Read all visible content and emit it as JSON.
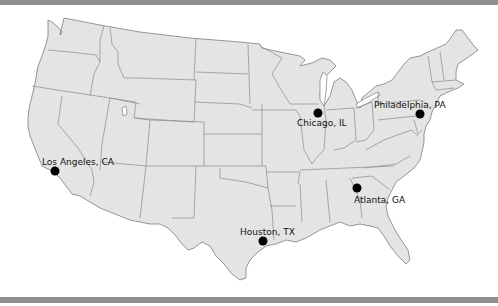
{
  "map": {
    "title": "United States city map",
    "land_color": "#e4e4e4",
    "border_color": "#7d7d7d",
    "marker_color": "#000000",
    "frame_band_color": "#8f8f8f"
  },
  "cities": [
    {
      "name": "Chicago, IL",
      "x": 318,
      "y": 113
    },
    {
      "name": "Philadelphia, PA",
      "x": 420,
      "y": 114
    },
    {
      "name": "Los Angeles, CA",
      "x": 55,
      "y": 171
    },
    {
      "name": "Atlanta, GA",
      "x": 357,
      "y": 188
    },
    {
      "name": "Houston, TX",
      "x": 263,
      "y": 241
    }
  ]
}
